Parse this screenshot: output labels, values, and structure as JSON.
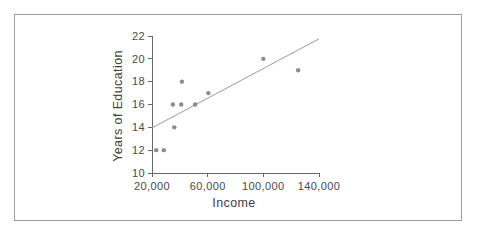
{
  "figure": {
    "background": "#ffffff",
    "frame_color": "#9e9e9e"
  },
  "chart_data": {
    "type": "scatter",
    "title": "",
    "xlabel": "Income",
    "ylabel": "Years of Education",
    "xlim": [
      20000,
      140000
    ],
    "ylim": [
      10,
      22
    ],
    "grid": false,
    "legend": "none",
    "x_ticks": [
      {
        "value": 20000,
        "label": "20,000"
      },
      {
        "value": 60000,
        "label": "60,000"
      },
      {
        "value": 100000,
        "label": "100,000"
      },
      {
        "value": 140000,
        "label": "140,000"
      }
    ],
    "y_ticks": [
      {
        "value": 10,
        "label": "10"
      },
      {
        "value": 12,
        "label": "12"
      },
      {
        "value": 14,
        "label": "14"
      },
      {
        "value": 16,
        "label": "16"
      },
      {
        "value": 18,
        "label": "18"
      },
      {
        "value": 20,
        "label": "20"
      },
      {
        "value": 22,
        "label": "22"
      }
    ],
    "points": [
      {
        "income": 23000,
        "education": 12
      },
      {
        "income": 28500,
        "education": 12
      },
      {
        "income": 35000,
        "education": 16
      },
      {
        "income": 36000,
        "education": 14
      },
      {
        "income": 41000,
        "education": 16
      },
      {
        "income": 41500,
        "education": 18
      },
      {
        "income": 51000,
        "education": 16
      },
      {
        "income": 60500,
        "education": 17
      },
      {
        "income": 100000,
        "education": 20
      },
      {
        "income": 125000,
        "education": 19
      }
    ],
    "trend_line": {
      "x1": 20000,
      "y1": 13.95,
      "x2": 140000,
      "y2": 21.75
    },
    "colors": {
      "point": "#8d8d8d",
      "trend": "#9b9b9b",
      "axis": "#676767",
      "tick_text": "#4a4a4a",
      "title_text": "#424242"
    }
  }
}
